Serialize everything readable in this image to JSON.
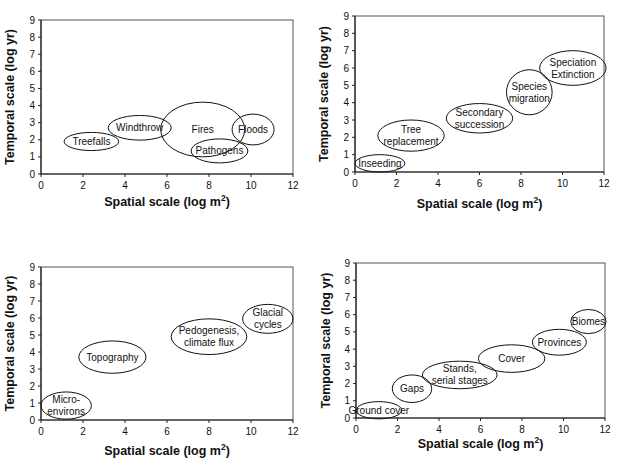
{
  "chart_data": [
    {
      "type": "scatter",
      "subtype": "ellipse-bubble",
      "title": "",
      "xlabel": "Spatial scale (log m2)",
      "ylabel": "Temporal scale (log yr)",
      "xlim": [
        0,
        12
      ],
      "ylim": [
        0,
        9
      ],
      "xticks": [
        0,
        2,
        4,
        6,
        8,
        10,
        12
      ],
      "yticks": [
        0,
        1,
        2,
        3,
        4,
        5,
        6,
        7,
        8,
        9
      ],
      "grid": false,
      "legend": "none",
      "items": [
        {
          "label": [
            "Treefalls"
          ],
          "cx": 2.4,
          "cy": 1.9,
          "rx": 1.3,
          "ry": 0.53
        },
        {
          "label": [
            "Windthrow"
          ],
          "cx": 4.7,
          "cy": 2.7,
          "rx": 1.5,
          "ry": 0.72
        },
        {
          "label": [
            "Fires"
          ],
          "cx": 7.7,
          "cy": 2.6,
          "rx": 2.0,
          "ry": 1.6
        },
        {
          "label": [
            "Floods"
          ],
          "cx": 10.1,
          "cy": 2.6,
          "rx": 1.0,
          "ry": 0.9
        },
        {
          "label": [
            "Pathogens"
          ],
          "cx": 8.5,
          "cy": 1.35,
          "rx": 1.35,
          "ry": 0.7
        }
      ]
    },
    {
      "type": "scatter",
      "subtype": "ellipse-bubble",
      "title": "",
      "xlabel": "Spatial scale (log m2)",
      "ylabel": "Temporal scale (log yr)",
      "xlim": [
        0,
        12
      ],
      "ylim": [
        0,
        9
      ],
      "xticks": [
        0,
        2,
        4,
        6,
        8,
        10,
        12
      ],
      "yticks": [
        0,
        1,
        2,
        3,
        4,
        5,
        6,
        7,
        8,
        9
      ],
      "grid": false,
      "legend": "none",
      "items": [
        {
          "label": [
            "Inseeding"
          ],
          "cx": 1.2,
          "cy": 0.5,
          "rx": 1.2,
          "ry": 0.5
        },
        {
          "label": [
            "Tree",
            "replacement"
          ],
          "cx": 2.7,
          "cy": 2.1,
          "rx": 1.6,
          "ry": 0.9
        },
        {
          "label": [
            "Secondary",
            "succession"
          ],
          "cx": 6.0,
          "cy": 3.1,
          "rx": 1.6,
          "ry": 0.85
        },
        {
          "label": [
            "Species",
            "migration"
          ],
          "cx": 8.4,
          "cy": 4.6,
          "rx": 1.1,
          "ry": 1.3
        },
        {
          "label": [
            "Speciation",
            "Extinction"
          ],
          "cx": 10.5,
          "cy": 6.0,
          "rx": 1.6,
          "ry": 1.0
        }
      ]
    },
    {
      "type": "scatter",
      "subtype": "ellipse-bubble",
      "title": "",
      "xlabel": "Spatial scale (log m2)",
      "ylabel": "Temporal scale (log yr)",
      "xlim": [
        0,
        12
      ],
      "ylim": [
        0,
        9
      ],
      "xticks": [
        0,
        2,
        4,
        6,
        8,
        10,
        12
      ],
      "yticks": [
        0,
        1,
        2,
        3,
        4,
        5,
        6,
        7,
        8,
        9
      ],
      "grid": false,
      "legend": "none",
      "items": [
        {
          "label": [
            "Micro-",
            "environs"
          ],
          "cx": 1.2,
          "cy": 0.85,
          "rx": 1.2,
          "ry": 0.8
        },
        {
          "label": [
            "Topography"
          ],
          "cx": 3.4,
          "cy": 3.7,
          "rx": 1.6,
          "ry": 0.95
        },
        {
          "label": [
            "Pedogenesis,",
            "climate flux"
          ],
          "cx": 8.0,
          "cy": 4.9,
          "rx": 1.8,
          "ry": 1.05
        },
        {
          "label": [
            "Glacial",
            "cycles"
          ],
          "cx": 10.8,
          "cy": 5.95,
          "rx": 1.2,
          "ry": 0.85
        }
      ]
    },
    {
      "type": "scatter",
      "subtype": "ellipse-bubble",
      "title": "",
      "xlabel": "Spatial scale (log m2)",
      "ylabel": "Temporal scale (log yr)",
      "xlim": [
        0,
        12
      ],
      "ylim": [
        0,
        9
      ],
      "xticks": [
        0,
        2,
        4,
        6,
        8,
        10,
        12
      ],
      "yticks": [
        0,
        1,
        2,
        3,
        4,
        5,
        6,
        7,
        8,
        9
      ],
      "grid": false,
      "legend": "none",
      "items": [
        {
          "label": [
            "Ground cover"
          ],
          "cx": 1.1,
          "cy": 0.45,
          "rx": 1.1,
          "ry": 0.5
        },
        {
          "label": [
            "Gaps"
          ],
          "cx": 2.7,
          "cy": 1.7,
          "rx": 0.95,
          "ry": 0.8
        },
        {
          "label": [
            "Stands,",
            "serial stages"
          ],
          "cx": 5.0,
          "cy": 2.5,
          "rx": 1.8,
          "ry": 0.8
        },
        {
          "label": [
            "Cover"
          ],
          "cx": 7.5,
          "cy": 3.45,
          "rx": 1.6,
          "ry": 0.8
        },
        {
          "label": [
            "Provinces"
          ],
          "cx": 9.8,
          "cy": 4.4,
          "rx": 1.3,
          "ry": 0.75
        },
        {
          "label": [
            "Biomes"
          ],
          "cx": 11.2,
          "cy": 5.6,
          "rx": 0.85,
          "ry": 0.7
        }
      ]
    }
  ],
  "layout": {
    "panels": [
      {
        "x0": 41,
        "x12": 293,
        "y0": 174,
        "y9": 20,
        "xlabel_y": 206,
        "ylabel_x": 14
      },
      {
        "x0": 355,
        "x12": 604,
        "y0": 172,
        "y9": 16,
        "xlabel_y": 208,
        "ylabel_x": 328
      },
      {
        "x0": 41,
        "x12": 293,
        "y0": 420,
        "y9": 267,
        "xlabel_y": 455,
        "ylabel_x": 14
      },
      {
        "x0": 356,
        "x12": 605,
        "y0": 418,
        "y9": 263,
        "xlabel_y": 448,
        "ylabel_x": 330
      }
    ]
  },
  "text": {
    "xlabel_main": "Spatial scale (log m",
    "xlabel_sup": "2",
    "xlabel_end": ")",
    "ylabel": "Temporal scale (log yr)"
  }
}
